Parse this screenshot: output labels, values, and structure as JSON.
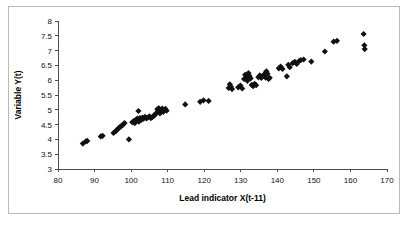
{
  "chart_data": {
    "type": "scatter",
    "title": "",
    "xlabel": "Lead indicator X(t-11)",
    "ylabel": "Variable Y(t)",
    "xlim": [
      80,
      170
    ],
    "ylim": [
      3,
      8
    ],
    "xticks": [
      80,
      90,
      100,
      110,
      120,
      130,
      140,
      150,
      160,
      170
    ],
    "yticks": [
      3,
      3.5,
      4,
      4.5,
      5,
      5.5,
      6,
      6.5,
      7,
      7.5,
      8
    ],
    "xtick_labels": [
      "80",
      "90",
      "100",
      "110",
      "120",
      "130",
      "140",
      "150",
      "160",
      "170"
    ],
    "ytick_labels": [
      "3",
      "3.5",
      "4",
      "4.5",
      "5",
      "5.5",
      "6",
      "6.5",
      "7",
      "7.5",
      "8"
    ],
    "grid": false,
    "legend": false,
    "marker_style": "diamond",
    "marker_color": "#101010",
    "marker_size": 3.1,
    "series": [
      {
        "name": "Y(t) vs X(t-11)",
        "points": [
          [
            86.8,
            3.86
          ],
          [
            87.6,
            3.93
          ],
          [
            88.0,
            3.95
          ],
          [
            91.7,
            4.1
          ],
          [
            92.2,
            4.12
          ],
          [
            95.2,
            4.22
          ],
          [
            95.8,
            4.28
          ],
          [
            96.2,
            4.33
          ],
          [
            96.6,
            4.38
          ],
          [
            97.0,
            4.42
          ],
          [
            97.4,
            4.46
          ],
          [
            97.8,
            4.5
          ],
          [
            98.2,
            4.55
          ],
          [
            99.4,
            4.0
          ],
          [
            100.3,
            4.58
          ],
          [
            100.7,
            4.62
          ],
          [
            101.0,
            4.55
          ],
          [
            101.3,
            4.66
          ],
          [
            101.7,
            4.7
          ],
          [
            102.0,
            4.96
          ],
          [
            102.1,
            4.6
          ],
          [
            102.4,
            4.72
          ],
          [
            102.8,
            4.66
          ],
          [
            103.1,
            4.74
          ],
          [
            103.4,
            4.7
          ],
          [
            103.8,
            4.76
          ],
          [
            104.2,
            4.71
          ],
          [
            104.6,
            4.74
          ],
          [
            105.0,
            4.78
          ],
          [
            105.4,
            4.72
          ],
          [
            105.8,
            4.75
          ],
          [
            106.2,
            4.8
          ],
          [
            106.6,
            4.84
          ],
          [
            107.0,
            4.9
          ],
          [
            107.2,
            5.02
          ],
          [
            107.4,
            4.96
          ],
          [
            107.6,
            5.05
          ],
          [
            107.9,
            4.88
          ],
          [
            108.2,
            4.98
          ],
          [
            108.5,
            5.04
          ],
          [
            108.8,
            4.93
          ],
          [
            109.1,
            5.0
          ],
          [
            109.4,
            5.03
          ],
          [
            109.7,
            4.97
          ],
          [
            114.8,
            5.18
          ],
          [
            118.9,
            5.27
          ],
          [
            119.8,
            5.32
          ],
          [
            121.2,
            5.3
          ],
          [
            126.7,
            5.74
          ],
          [
            127.0,
            5.86
          ],
          [
            127.3,
            5.78
          ],
          [
            127.6,
            5.7
          ],
          [
            129.3,
            5.76
          ],
          [
            129.9,
            5.82
          ],
          [
            130.4,
            5.72
          ],
          [
            130.9,
            6.04
          ],
          [
            131.2,
            6.18
          ],
          [
            131.5,
            6.1
          ],
          [
            131.8,
            5.98
          ],
          [
            132.1,
            6.24
          ],
          [
            132.4,
            6.14
          ],
          [
            132.7,
            6.06
          ],
          [
            133.0,
            5.84
          ],
          [
            133.4,
            5.8
          ],
          [
            133.8,
            5.88
          ],
          [
            134.2,
            5.83
          ],
          [
            134.8,
            6.1
          ],
          [
            135.2,
            6.16
          ],
          [
            135.6,
            6.08
          ],
          [
            136.0,
            6.13
          ],
          [
            136.4,
            6.2
          ],
          [
            136.8,
            6.09
          ],
          [
            137.0,
            6.3
          ],
          [
            137.3,
            6.22
          ],
          [
            137.6,
            6.04
          ],
          [
            137.9,
            6.08
          ],
          [
            140.4,
            6.4
          ],
          [
            140.9,
            6.46
          ],
          [
            141.4,
            6.38
          ],
          [
            142.6,
            6.13
          ],
          [
            143.0,
            6.52
          ],
          [
            143.4,
            6.44
          ],
          [
            144.2,
            6.58
          ],
          [
            144.8,
            6.62
          ],
          [
            145.3,
            6.55
          ],
          [
            145.9,
            6.64
          ],
          [
            146.4,
            6.68
          ],
          [
            147.2,
            6.7
          ],
          [
            149.3,
            6.63
          ],
          [
            153.0,
            6.97
          ],
          [
            155.4,
            7.3
          ],
          [
            156.3,
            7.33
          ],
          [
            163.6,
            7.56
          ],
          [
            163.8,
            7.18
          ],
          [
            163.9,
            7.05
          ]
        ]
      }
    ]
  }
}
